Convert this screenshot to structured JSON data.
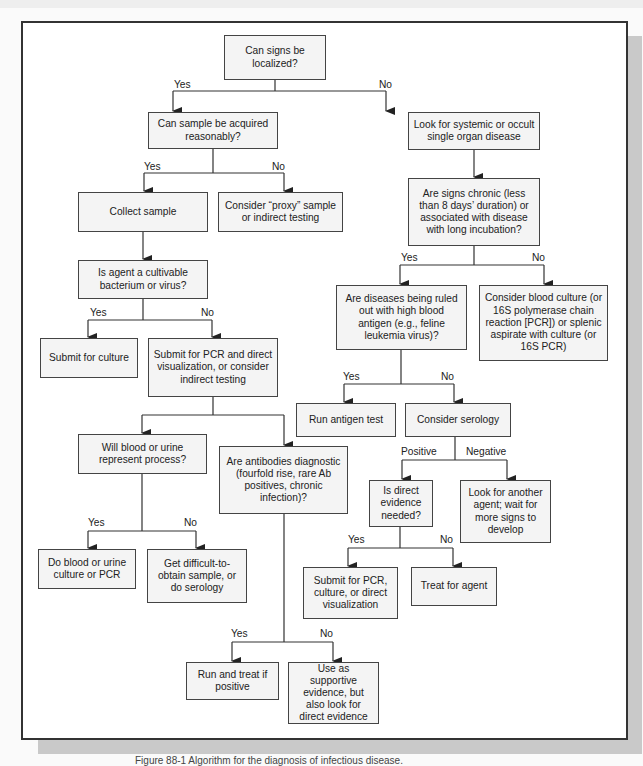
{
  "diagram": {
    "nodes": [
      {
        "id": "n1",
        "text": "Can signs be localized?"
      },
      {
        "id": "n2",
        "text": "Can sample be acquired reasonably?"
      },
      {
        "id": "n3",
        "text": "Look for systemic or occult single organ disease"
      },
      {
        "id": "n4",
        "text": "Collect sample"
      },
      {
        "id": "n5",
        "text": "Consider “proxy” sample or indirect testing"
      },
      {
        "id": "n6",
        "text": "Are signs chronic (less than 8 days’ duration) or associated with disease with long incubation?"
      },
      {
        "id": "n7",
        "text": "Is agent a cultivable bacterium or virus?"
      },
      {
        "id": "n8",
        "text": "Are diseases being ruled out with high blood antigen (e.g., feline leukemia virus)?"
      },
      {
        "id": "n9",
        "text": "Consider blood culture (or 16S polymerase chain reaction [PCR]) or splenic aspirate with culture (or 16S PCR)"
      },
      {
        "id": "n10",
        "text": "Submit for culture"
      },
      {
        "id": "n11",
        "text": "Submit for PCR and direct visualization, or consider indirect testing"
      },
      {
        "id": "n12",
        "text": "Run antigen test"
      },
      {
        "id": "n13",
        "text": "Consider serology"
      },
      {
        "id": "n14",
        "text": "Will blood or urine represent process?"
      },
      {
        "id": "n15",
        "text": "Are antibodies diagnostic (fourfold rise, rare Ab positives, chronic infection)?"
      },
      {
        "id": "n16",
        "text": "Is direct evidence needed?"
      },
      {
        "id": "n17",
        "text": "Look for another agent; wait for more signs to develop"
      },
      {
        "id": "n18",
        "text": "Do blood or urine culture or PCR"
      },
      {
        "id": "n19",
        "text": "Get difficult-to-obtain sample, or do serology"
      },
      {
        "id": "n20",
        "text": "Submit for PCR, culture, or direct visualization"
      },
      {
        "id": "n21",
        "text": "Treat for agent"
      },
      {
        "id": "n22",
        "text": "Run and treat if positive"
      },
      {
        "id": "n23",
        "text": "Use as supportive evidence, but also look for direct evidence"
      }
    ],
    "edge_labels": {
      "n1_yes": "Yes",
      "n1_no": "No",
      "n2_yes": "Yes",
      "n2_no": "No",
      "n6_yes": "Yes",
      "n6_no": "No",
      "n7_yes": "Yes",
      "n7_no": "No",
      "n8_yes": "Yes",
      "n8_no": "No",
      "n13_pos": "Positive",
      "n13_neg": "Negative",
      "n14_yes": "Yes",
      "n14_no": "No",
      "n16_yes": "Yes",
      "n16_no": "No",
      "n15_yes": "Yes",
      "n15_no": "No"
    },
    "colors": {
      "box_fill": "#f4f4f4",
      "box_border": "#444444",
      "frame": "#333333",
      "shadow": "#c9c9c9"
    }
  },
  "caption": "Figure 88-1 Algorithm for the diagnosis of infectious disease."
}
